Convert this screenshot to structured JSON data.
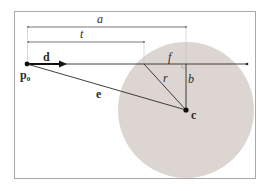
{
  "diagram": {
    "title": "",
    "colors": {
      "background": "#ffffff",
      "frame": "#9a9a9a",
      "sphere_fill": "#ddd5d1",
      "line": "#2a2a2a",
      "guide": "#b0b0b0"
    },
    "labels": {
      "a": "a",
      "t": "t",
      "d": "d",
      "p0": "p",
      "p0_sub": "0",
      "f": "f",
      "r": "r",
      "b": "b",
      "e": "e",
      "c": "c"
    },
    "nodes": [
      {
        "id": "p0",
        "label": "p0",
        "kind": "ray-origin-point"
      },
      {
        "id": "c",
        "label": "c",
        "kind": "sphere-center-point"
      }
    ],
    "edges": [
      {
        "from": "p0",
        "direction": "d",
        "label": "ray",
        "kind": "arrow"
      },
      {
        "from": "p0",
        "to": "c",
        "label": "e",
        "kind": "line"
      },
      {
        "from": "c",
        "to": "ray-intersection",
        "label": "r",
        "kind": "line"
      },
      {
        "from": "c",
        "to": "closest-point",
        "label": "b",
        "kind": "line"
      },
      {
        "from": "intersection",
        "to": "closest-point",
        "label": "f",
        "kind": "segment"
      },
      {
        "from": "p0",
        "to": "closest-point",
        "label": "a",
        "kind": "dimension"
      },
      {
        "from": "p0",
        "to": "intersection",
        "label": "t",
        "kind": "dimension"
      }
    ]
  }
}
